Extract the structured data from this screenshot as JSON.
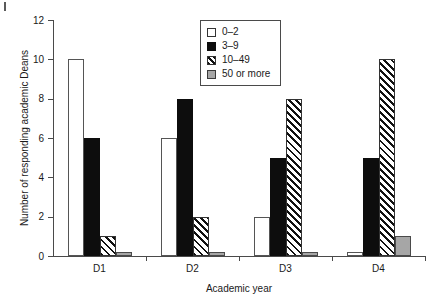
{
  "chart_data": {
    "type": "bar",
    "title": "",
    "xlabel": "Academic year",
    "ylabel": "Number of responding academic Deans",
    "categories": [
      "D1",
      "D2",
      "D3",
      "D4"
    ],
    "series": [
      {
        "name": "0–2",
        "values": [
          10,
          6,
          2,
          0.2
        ]
      },
      {
        "name": "3–9",
        "values": [
          6,
          8,
          5,
          5
        ]
      },
      {
        "name": "10–49",
        "values": [
          1,
          2,
          8,
          10
        ]
      },
      {
        "name": "50 or more",
        "values": [
          0.2,
          0.2,
          0.2,
          1
        ]
      }
    ],
    "ylim": [
      0,
      12
    ],
    "yticks": [
      0,
      2,
      4,
      6,
      8,
      10,
      12
    ],
    "ytick_labels": [
      "0",
      "2",
      "4",
      "6",
      "8",
      "10",
      "12"
    ],
    "grid": false,
    "legend_position": "top-center",
    "colors": {
      "0–2": "#ffffff",
      "3–9": "#0d0d0d",
      "10–49": "#ffffff",
      "50 or more": "#a6a6a6",
      "axis": "#4a4a4a",
      "text": "#1a1a1a"
    }
  },
  "legend": {
    "items": [
      {
        "label": "0–2"
      },
      {
        "label": "3–9"
      },
      {
        "label": "10–49"
      },
      {
        "label": "50 or more"
      }
    ]
  }
}
